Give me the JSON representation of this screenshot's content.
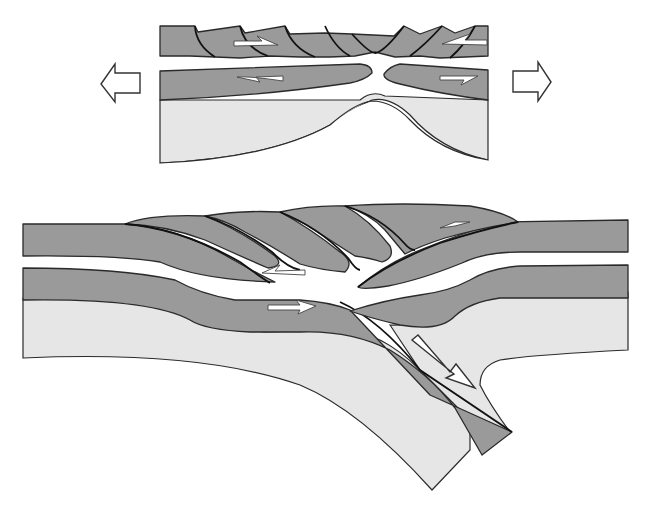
{
  "diagram": {
    "title": "",
    "type": "geologic cross-section (extension and thrust/subduction)",
    "panels": [
      {
        "id": "top",
        "description": "Lithospheric extension: upper crust broken into tilted fault blocks, lower layer necking, mantle upwelling",
        "arrows": [
          {
            "name": "extension-left-arrow",
            "direction": "left"
          },
          {
            "name": "extension-right-arrow",
            "direction": "right"
          }
        ],
        "shear_arrows": 4
      },
      {
        "id": "bottom",
        "description": "Convergence: stacked thrust slices over a descending slab",
        "shear_arrows": 4,
        "subduction_arrow": "down-right"
      }
    ],
    "colors": {
      "crust": "#9a9a9a",
      "mantle": "#e6e6e6",
      "background": "#ffffff",
      "outline": "#2a2a2a"
    }
  }
}
